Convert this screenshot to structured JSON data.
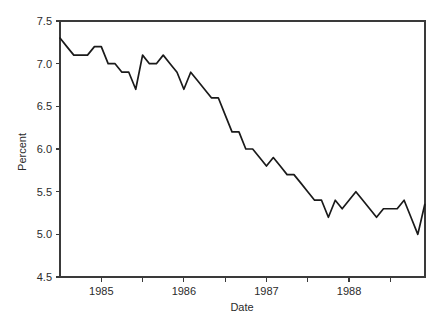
{
  "chart_data": {
    "type": "line",
    "title": "",
    "xlabel": "Date",
    "ylabel": "Percent",
    "grid": false,
    "legend": null,
    "ylim": [
      4.5,
      7.5
    ],
    "xlim": [
      1984.5,
      1988.92
    ],
    "ytick_labels": [
      "4.5",
      "5.0",
      "5.5",
      "6.0",
      "6.5",
      "7.0",
      "7.5"
    ],
    "ytick_values": [
      4.5,
      5.0,
      5.5,
      6.0,
      6.5,
      7.0,
      7.5
    ],
    "xtick_labels": [
      "1985",
      "1986",
      "1987",
      "1988"
    ],
    "xtick_values": [
      1985,
      1986,
      1987,
      1988
    ],
    "xminor_tick_values": [
      1985.5,
      1986.5,
      1987.5,
      1988.5
    ],
    "series": [
      {
        "name": "Percent",
        "color": "#1a1a1a",
        "x": [
          1984.5,
          1984.583,
          1984.667,
          1984.75,
          1984.833,
          1984.917,
          1985.0,
          1985.083,
          1985.167,
          1985.25,
          1985.333,
          1985.417,
          1985.5,
          1985.583,
          1985.667,
          1985.75,
          1985.833,
          1985.917,
          1986.0,
          1986.083,
          1986.167,
          1986.25,
          1986.333,
          1986.417,
          1986.5,
          1986.583,
          1986.667,
          1986.75,
          1986.833,
          1986.917,
          1987.0,
          1987.083,
          1987.167,
          1987.25,
          1987.333,
          1987.417,
          1987.5,
          1987.583,
          1987.667,
          1987.75,
          1987.833,
          1987.917,
          1988.0,
          1988.083,
          1988.167,
          1988.25,
          1988.333,
          1988.417,
          1988.5,
          1988.583,
          1988.667,
          1988.75,
          1988.833,
          1988.917
        ],
        "values": [
          7.3,
          7.2,
          7.1,
          7.1,
          7.1,
          7.2,
          7.2,
          7.0,
          7.0,
          6.9,
          6.9,
          6.7,
          7.1,
          7.0,
          7.0,
          7.1,
          7.0,
          6.9,
          6.7,
          6.9,
          6.8,
          6.7,
          6.6,
          6.6,
          6.4,
          6.2,
          6.2,
          6.0,
          6.0,
          5.9,
          5.8,
          5.9,
          5.8,
          5.7,
          5.7,
          5.6,
          5.5,
          5.4,
          5.4,
          5.2,
          5.4,
          5.3,
          5.4,
          5.5,
          5.4,
          5.3,
          5.2,
          5.3,
          5.3,
          5.3,
          5.4,
          5.2,
          5.0,
          5.35
        ]
      }
    ]
  },
  "axes": {
    "y_title": "Percent",
    "x_title": "Date"
  }
}
